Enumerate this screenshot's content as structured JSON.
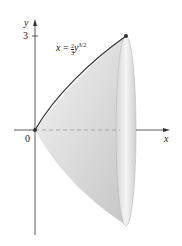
{
  "figure": {
    "x_axis_label": "x",
    "y_axis_label": "y",
    "origin_label": "0",
    "y_tick_label": "3",
    "equation": {
      "lhs": "x",
      "eq": " = ",
      "frac_num": "2",
      "frac_den": "3",
      "var": "y",
      "exponent": "3/2"
    },
    "colors": {
      "axis": "#333333",
      "curve": "#333333",
      "surface_light": "#f2f2f2",
      "surface_dark": "#c8c8c8",
      "dashed": "#999999"
    }
  }
}
